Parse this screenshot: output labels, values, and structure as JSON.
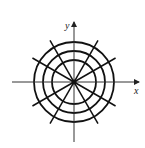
{
  "diagram": {
    "type": "polar-grid",
    "axes": {
      "x_label": "x",
      "y_label": "y"
    },
    "center": [
      74,
      82
    ],
    "circle_radii": [
      22,
      31,
      40
    ],
    "ray_count": 12,
    "ray_angle_step_deg": 30,
    "ray_length": 48,
    "line_color": "#111111"
  }
}
